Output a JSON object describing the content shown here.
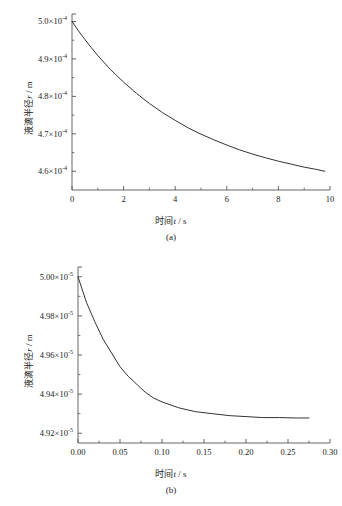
{
  "figures": [
    {
      "id": "a",
      "caption": "(a)",
      "xlabel_cn": "时间",
      "xlabel_var": "t",
      "xlabel_unit": "/ s",
      "ylabel_cn": "液滴半径",
      "ylabel_var": "r",
      "ylabel_unit": "/ m",
      "xticks": [
        "0",
        "2",
        "4",
        "6",
        "8",
        "10"
      ],
      "yticks": [
        {
          "mantissa": "5.0",
          "exponent": "-4"
        },
        {
          "mantissa": "4.9",
          "exponent": "-4"
        },
        {
          "mantissa": "4.8",
          "exponent": "-4"
        },
        {
          "mantissa": "4.7",
          "exponent": "-4"
        },
        {
          "mantissa": "4.6",
          "exponent": "-4"
        }
      ]
    },
    {
      "id": "b",
      "caption": "(b)",
      "xlabel_cn": "时间",
      "xlabel_var": "t",
      "xlabel_unit": "/ s",
      "ylabel_cn": "液滴半径",
      "ylabel_var": "r",
      "ylabel_unit": "/ m",
      "xticks": [
        "0.00",
        "0.05",
        "0.10",
        "0.15",
        "0.20",
        "0.25",
        "0.30"
      ],
      "yticks": [
        {
          "mantissa": "5.00",
          "exponent": "-5"
        },
        {
          "mantissa": "4.98",
          "exponent": "-5"
        },
        {
          "mantissa": "4.96",
          "exponent": "-5"
        },
        {
          "mantissa": "4.94",
          "exponent": "-5"
        },
        {
          "mantissa": "4.92",
          "exponent": "-5"
        }
      ]
    }
  ],
  "chart_data": [
    {
      "type": "line",
      "title": "(a)",
      "xlabel": "时间 t / s",
      "ylabel": "液滴半径 r / m",
      "xlim": [
        0,
        10
      ],
      "ylim": [
        0.000455,
        0.000502
      ],
      "xticks": [
        0,
        2,
        4,
        6,
        8,
        10
      ],
      "yticks": [
        0.00046,
        0.00047,
        0.00048,
        0.00049,
        0.0005
      ],
      "minor_ticks": true,
      "grid": false,
      "legend": null,
      "series": [
        {
          "name": "droplet radius decay",
          "x": [
            0,
            0.25,
            0.5,
            0.75,
            1.0,
            1.5,
            2.0,
            2.5,
            3.0,
            3.5,
            4.0,
            4.5,
            5.0,
            5.5,
            6.0,
            6.5,
            7.0,
            7.5,
            8.0,
            8.5,
            9.0,
            9.4,
            9.8
          ],
          "y": [
            0.0005,
            0.0004975,
            0.0004952,
            0.000493,
            0.0004909,
            0.0004871,
            0.0004838,
            0.0004808,
            0.0004781,
            0.0004757,
            0.0004736,
            0.0004716,
            0.0004699,
            0.0004684,
            0.000467,
            0.0004657,
            0.0004646,
            0.0004636,
            0.0004627,
            0.0004619,
            0.0004611,
            0.0004606,
            0.00046
          ]
        }
      ]
    },
    {
      "type": "line",
      "title": "(b)",
      "xlabel": "时间 t / s",
      "ylabel": "液滴半径 r / m",
      "xlim": [
        0.0,
        0.3
      ],
      "ylim": [
        4.915e-05,
        5.005e-05
      ],
      "xticks": [
        0.0,
        0.05,
        0.1,
        0.15,
        0.2,
        0.25,
        0.3
      ],
      "yticks": [
        4.92e-05,
        4.94e-05,
        4.96e-05,
        4.98e-05,
        5e-05
      ],
      "minor_ticks": true,
      "grid": false,
      "legend": null,
      "series": [
        {
          "name": "droplet radius decay",
          "x": [
            0.0,
            0.01,
            0.02,
            0.03,
            0.04,
            0.05,
            0.06,
            0.07,
            0.08,
            0.09,
            0.1,
            0.12,
            0.14,
            0.16,
            0.18,
            0.2,
            0.22,
            0.24,
            0.26,
            0.275
          ],
          "y": [
            5e-05,
            4.987e-05,
            4.977e-05,
            4.968e-05,
            4.961e-05,
            4.954e-05,
            4.949e-05,
            4.945e-05,
            4.941e-05,
            4.938e-05,
            4.936e-05,
            4.933e-05,
            4.931e-05,
            4.93e-05,
            4.929e-05,
            4.9285e-05,
            4.928e-05,
            4.928e-05,
            4.9278e-05,
            4.9278e-05
          ]
        }
      ]
    }
  ],
  "style": {
    "line_color": "#333333",
    "axis_color": "#555555",
    "background": "#ffffff"
  }
}
